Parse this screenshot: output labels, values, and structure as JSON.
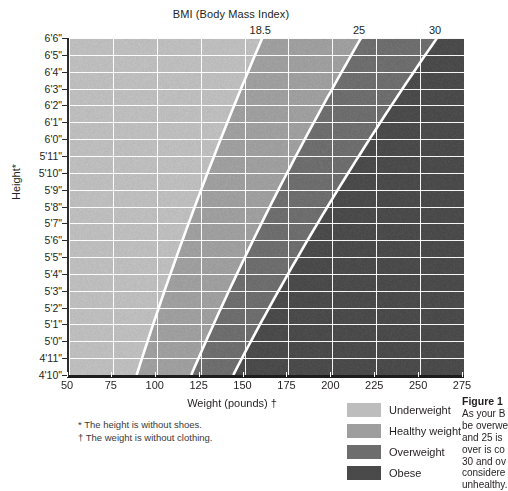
{
  "chart_data": {
    "type": "heatmap",
    "title": "BMI (Body Mass Index)",
    "xlabel": "Weight (pounds) †",
    "ylabel": "Height*",
    "xlim": [
      50,
      275
    ],
    "ylim_inches": [
      58,
      78
    ],
    "grid": true,
    "x_ticks": [
      50,
      75,
      100,
      125,
      150,
      175,
      200,
      225,
      250,
      275
    ],
    "y_ticks": [
      "4'10\"",
      "4'11\"",
      "5'0\"",
      "5'1\"",
      "5'2\"",
      "5'3\"",
      "5'4\"",
      "5'5\"",
      "5'6\"",
      "5'7\"",
      "5'8\"",
      "5'9\"",
      "5'10\"",
      "5'11\"",
      "6'0\"",
      "6'1\"",
      "6'2\"",
      "6'3\"",
      "6'4\"",
      "6'5\"",
      "6'6\""
    ],
    "bmi_boundaries": [
      {
        "value": "18.5",
        "label": "18.5",
        "separates": "Underweight / Healthy weight"
      },
      {
        "value": "25",
        "label": "25",
        "separates": "Healthy weight / Overweight"
      },
      {
        "value": "30",
        "label": "30",
        "separates": "Overweight / Obese"
      }
    ],
    "bands": [
      {
        "name": "Underweight",
        "bmi_range": "below 18.5",
        "color": "#bdbdbd"
      },
      {
        "name": "Healthy weight",
        "bmi_range": "18.5 to 25",
        "color": "#9e9e9e"
      },
      {
        "name": "Overweight",
        "bmi_range": "25 to 30",
        "color": "#6d6d6d"
      },
      {
        "name": "Obese",
        "bmi_range": "30 and over",
        "color": "#4a4a4a"
      }
    ],
    "boundary_line_color": "#ffffff",
    "gridline_color": "#ffffff",
    "legend_position": "bottom-right"
  },
  "chart": {
    "title": "BMI (Body Mass Index)",
    "x_axis_title": "Weight (pounds) †",
    "y_axis_title": "Height*",
    "x_ticks": [
      "50",
      "75",
      "100",
      "125",
      "150",
      "175",
      "200",
      "225",
      "250",
      "275"
    ],
    "y_ticks": [
      "6'6\"",
      "6'5\"",
      "6'4\"",
      "6'3\"",
      "6'2\"",
      "6'1\"",
      "6'0\"",
      "5'11\"",
      "5'10\"",
      "5'9\"",
      "5'8\"",
      "5'7\"",
      "5'6\"",
      "5'5\"",
      "5'4\"",
      "5'3\"",
      "5'2\"",
      "5'1\"",
      "5'0\"",
      "4'11\"",
      "4'10\""
    ],
    "bmi_labels": [
      "18.5",
      "25",
      "30"
    ]
  },
  "legend": {
    "items": [
      {
        "label": "Underweight",
        "color": "#bdbdbd"
      },
      {
        "label": "Healthy weight",
        "color": "#9e9e9e"
      },
      {
        "label": "Overweight",
        "color": "#6d6d6d"
      },
      {
        "label": "Obese",
        "color": "#4a4a4a"
      }
    ]
  },
  "footnotes": {
    "height_note": "* The height is without shoes.",
    "weight_note": "† The weight is without clothing."
  },
  "caption": {
    "title": "Figure 1",
    "lines": [
      "As your B",
      "be overwe",
      "and 25 is",
      "over is co",
      "30 and ov",
      "considere",
      "unhealthy."
    ]
  }
}
